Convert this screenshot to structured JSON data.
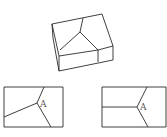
{
  "diagram": {
    "box3d": {
      "outline": "52,24 102,14 113,46 113,60 59,71 59,56 52,24",
      "edges": [
        {
          "name": "left-vertical-edge",
          "points": "52,24 53,38 59,71"
        },
        {
          "name": "front-top-edge",
          "points": "59,56 98,50 113,46"
        },
        {
          "name": "front-divider",
          "points": "98,50 98,62"
        },
        {
          "name": "inner-ridge-top",
          "points": "80,32 83,18"
        },
        {
          "name": "inner-ridge-left",
          "points": "80,32 60,50"
        },
        {
          "name": "inner-ridge-right",
          "points": "80,32 98,50"
        }
      ]
    },
    "views": [
      {
        "name": "left-view",
        "rect": {
          "x": 4,
          "y": 87,
          "w": 59,
          "h": 40
        },
        "lines": [
          "37,103 44,87",
          "37,103 4,117",
          "37,103 51,127"
        ],
        "label": {
          "text": "A",
          "x": 40,
          "y": 107
        }
      },
      {
        "name": "right-view",
        "rect": {
          "x": 102,
          "y": 87,
          "w": 64,
          "h": 40
        },
        "lines": [
          "137,107 147,87",
          "137,107 102,107",
          "137,107 148,127"
        ],
        "label": {
          "text": "A",
          "x": 140,
          "y": 110
        }
      }
    ]
  }
}
